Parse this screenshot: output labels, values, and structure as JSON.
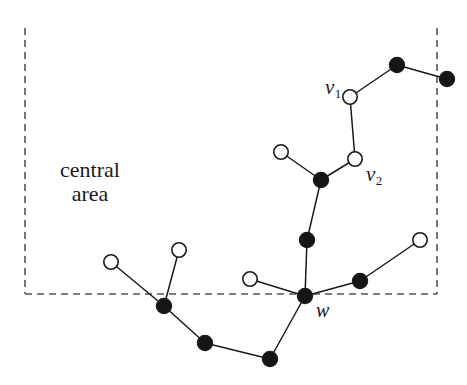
{
  "figure": {
    "background_color": "#ffffff",
    "stroke_color": "#1a1a1a",
    "node_fill_black": "#151515",
    "node_fill_white": "#ffffff",
    "dashed_color": "#555555"
  },
  "labels": {
    "central_area_line1": "central",
    "central_area_line2": "area",
    "v1_name": "v",
    "v1_sub": "1",
    "v2_name": "v",
    "v2_sub": "2",
    "w_name": "w"
  },
  "chart_data": {
    "type": "scatter",
    "title": "central area",
    "xlabel": "",
    "ylabel": "",
    "xlim": [
      0,
      467
    ],
    "ylim": [
      385,
      0
    ],
    "grid": false,
    "legend": null,
    "annotations": [
      {
        "text": "central area",
        "x": 88,
        "y": 172
      },
      {
        "text": "v1",
        "x": 333,
        "y": 88
      },
      {
        "text": "v2",
        "x": 372,
        "y": 175
      },
      {
        "text": "w",
        "x": 321,
        "y": 312
      }
    ],
    "regions": [
      {
        "name": "central-area",
        "style": "dashed",
        "x1": 25,
        "y1": 28,
        "x2": 437,
        "y2": 294,
        "edges_drawn": [
          "left",
          "right",
          "bottom"
        ]
      }
    ],
    "nodes": [
      {
        "id": "n1",
        "label": "",
        "x": 397,
        "y": 65,
        "fill": "black"
      },
      {
        "id": "n2",
        "label": "",
        "x": 447,
        "y": 79,
        "fill": "black"
      },
      {
        "id": "v1",
        "label": "v1",
        "x": 350,
        "y": 97,
        "fill": "white"
      },
      {
        "id": "v2",
        "label": "v2",
        "x": 355,
        "y": 159,
        "fill": "white"
      },
      {
        "id": "n5",
        "label": "",
        "x": 281,
        "y": 152,
        "fill": "white"
      },
      {
        "id": "n6",
        "label": "",
        "x": 321,
        "y": 180,
        "fill": "black"
      },
      {
        "id": "n7",
        "label": "",
        "x": 307,
        "y": 240,
        "fill": "black"
      },
      {
        "id": "w",
        "label": "w",
        "x": 305,
        "y": 296,
        "fill": "black"
      },
      {
        "id": "n9",
        "label": "",
        "x": 250,
        "y": 279,
        "fill": "white"
      },
      {
        "id": "n10",
        "label": "",
        "x": 360,
        "y": 281,
        "fill": "black"
      },
      {
        "id": "n11",
        "label": "",
        "x": 420,
        "y": 240,
        "fill": "white"
      },
      {
        "id": "n12",
        "label": "",
        "x": 111,
        "y": 262,
        "fill": "white"
      },
      {
        "id": "n13",
        "label": "",
        "x": 179,
        "y": 250,
        "fill": "white"
      },
      {
        "id": "n14",
        "label": "",
        "x": 164,
        "y": 306,
        "fill": "black"
      },
      {
        "id": "n15",
        "label": "",
        "x": 205,
        "y": 343,
        "fill": "black"
      },
      {
        "id": "n16",
        "label": "",
        "x": 270,
        "y": 359,
        "fill": "black"
      }
    ],
    "edges": [
      [
        "n1",
        "n2"
      ],
      [
        "n1",
        "v1"
      ],
      [
        "v1",
        "v2"
      ],
      [
        "v2",
        "n6"
      ],
      [
        "n5",
        "n6"
      ],
      [
        "n6",
        "n7"
      ],
      [
        "n7",
        "w"
      ],
      [
        "n9",
        "w"
      ],
      [
        "w",
        "n10"
      ],
      [
        "n10",
        "n11"
      ],
      [
        "w",
        "n16"
      ],
      [
        "n16",
        "n15"
      ],
      [
        "n15",
        "n14"
      ],
      [
        "n14",
        "n12"
      ],
      [
        "n14",
        "n13"
      ]
    ]
  }
}
